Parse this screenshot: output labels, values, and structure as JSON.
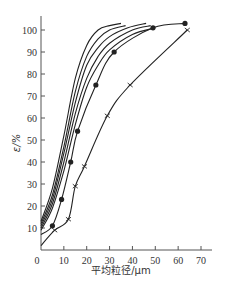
{
  "chart_data": {
    "type": "line",
    "title": "",
    "xlabel": "平均粒径/μm",
    "ylabel": "ε/%",
    "xlim": [
      0,
      70
    ],
    "ylim": [
      0,
      105
    ],
    "xticks": [
      0,
      10,
      20,
      30,
      40,
      50,
      60,
      70
    ],
    "yticks": [
      10,
      20,
      30,
      40,
      50,
      60,
      70,
      80,
      90,
      100
    ],
    "grid": false,
    "legend": null,
    "series": [
      {
        "name": "curve-1",
        "marker": "none",
        "x": [
          0,
          5,
          10,
          15,
          20,
          25,
          30,
          35
        ],
        "y": [
          13,
          28,
          52,
          78,
          93,
          100,
          102,
          103
        ]
      },
      {
        "name": "curve-2",
        "marker": "none",
        "x": [
          0,
          5,
          10,
          15,
          20,
          25,
          30,
          37
        ],
        "y": [
          12,
          25,
          47,
          72,
          88,
          96,
          100,
          102
        ]
      },
      {
        "name": "curve-3",
        "marker": "none",
        "x": [
          0,
          5,
          10,
          15,
          20,
          25,
          30,
          38,
          46
        ],
        "y": [
          11,
          23,
          44,
          67,
          84,
          92,
          97,
          101,
          103
        ]
      },
      {
        "name": "curve-4",
        "marker": "none",
        "x": [
          0,
          5,
          10,
          15,
          20,
          25,
          30,
          40,
          48
        ],
        "y": [
          10,
          21,
          40,
          62,
          78,
          88,
          94,
          100,
          102
        ]
      },
      {
        "name": "curve-5",
        "marker": "none",
        "x": [
          0,
          5,
          10,
          15,
          20,
          25,
          30,
          40,
          50
        ],
        "y": [
          9,
          19,
          36,
          57,
          74,
          84,
          91,
          98,
          101
        ]
      },
      {
        "name": "dot-series",
        "marker": "circle",
        "x": [
          0,
          5,
          9,
          13,
          16,
          24,
          32,
          49,
          63
        ],
        "y": [
          7,
          11,
          23,
          40,
          54,
          75,
          90,
          101,
          103
        ]
      },
      {
        "name": "cross-series",
        "marker": "x",
        "x": [
          0,
          6,
          12,
          15,
          19,
          29,
          39,
          64
        ],
        "y": [
          2,
          9,
          14,
          29,
          38,
          61,
          75,
          100
        ]
      }
    ]
  },
  "axes": {
    "xlabel": "平均粒径/μm",
    "ylabel": "ε/%",
    "x_tick_labels": [
      "0",
      "10",
      "20",
      "30",
      "40",
      "50",
      "60",
      "70"
    ],
    "y_tick_labels": [
      "10",
      "20",
      "30",
      "40",
      "50",
      "60",
      "70",
      "80",
      "90",
      "100"
    ]
  },
  "colors": {
    "line": "#222222",
    "axis": "#555555",
    "text": "#333333"
  }
}
